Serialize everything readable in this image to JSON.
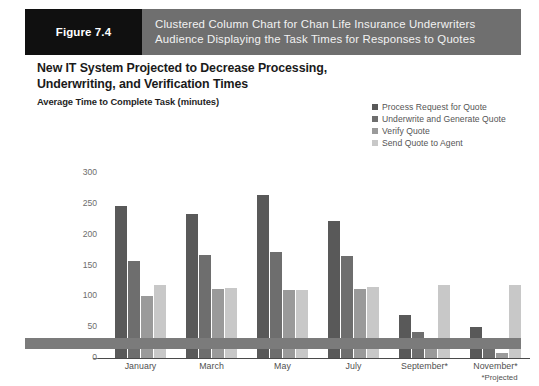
{
  "figure": {
    "number_label": "Figure 7.4",
    "caption_line1": "Clustered Column Chart for Chan Life Insurance Underwriters",
    "caption_line2": "Audience Displaying the Task Times for Responses to Quotes"
  },
  "colors": {
    "header_band": "#6f6f6f",
    "figure_number_box": "#101010",
    "bottom_bar": "#7b7b7b",
    "series1": "#595959",
    "series2": "#6e6e6e",
    "series3": "#9a9a9a",
    "series4": "#c8c8c8",
    "axis": "#4a4a4a"
  },
  "chart_data": {
    "type": "bar",
    "title": "New IT System Projected to Decrease Processing, Underwriting, and Verification Times",
    "subtitle": "Average Time to Complete Task (minutes)",
    "xlabel": "",
    "ylabel": "",
    "ylim": [
      0,
      300
    ],
    "yticks": [
      300,
      250,
      200,
      150,
      100,
      50,
      0
    ],
    "grid": false,
    "legend_position": "top-right",
    "footnote": "*Projected",
    "categories": [
      "January",
      "March",
      "May",
      "July",
      "September*",
      "November*"
    ],
    "series": [
      {
        "name": "Process Request for Quote",
        "color": "#595959",
        "values": [
          247,
          233,
          265,
          222,
          70,
          50
        ]
      },
      {
        "name": "Underwrite and Generate Quote",
        "color": "#6e6e6e",
        "values": [
          158,
          167,
          172,
          165,
          42,
          25
        ]
      },
      {
        "name": "Verify Quote",
        "color": "#9a9a9a",
        "values": [
          100,
          112,
          110,
          112,
          20,
          8
        ]
      },
      {
        "name": "Send Quote to Agent",
        "color": "#c8c8c8",
        "values": [
          118,
          113,
          110,
          115,
          118,
          118
        ]
      }
    ]
  }
}
